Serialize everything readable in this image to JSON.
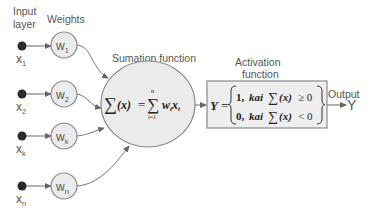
{
  "diagram": {
    "type": "perceptron-neuron-model",
    "labels": {
      "input_layer_line1": "Input",
      "input_layer_line2": "layer",
      "weights": "Weights",
      "summation": "Sumation function",
      "activation_line1": "Activation",
      "activation_line2": "function",
      "output": "Output",
      "output_symbol": "Y"
    },
    "inputs": [
      {
        "var": "x",
        "sub": "1"
      },
      {
        "var": "x",
        "sub": "2"
      },
      {
        "var": "x",
        "sub": "k"
      },
      {
        "var": "x",
        "sub": "n"
      }
    ],
    "weights": [
      {
        "var": "w",
        "sub": "1"
      },
      {
        "var": "w",
        "sub": "2"
      },
      {
        "var": "w",
        "sub": "k"
      },
      {
        "var": "w",
        "sub": "n"
      }
    ],
    "summation_formula": {
      "lhs_sigma": "∑",
      "lhs_arg": "(x)",
      "equals": "=",
      "rhs_sigma": "∑",
      "upper": "n",
      "lower": "i=1",
      "term_w": "w",
      "term_w_sub": "i",
      "term_x": "x",
      "term_x_sub": "i"
    },
    "activation_formula": {
      "lhs": "Y",
      "equals": "=",
      "case1_value": "1,",
      "case1_word": "kai",
      "case1_sigma": "∑",
      "case1_arg": "(x)",
      "case1_cond": "≥ 0",
      "case2_value": "0,",
      "case2_word": "kai",
      "case2_sigma": "∑",
      "case2_arg": "(x)",
      "case2_cond": "< 0"
    },
    "colors": {
      "node_fill": "#ebebeb",
      "stroke": "#8a8a8a",
      "input_dot": "#2a2a2a",
      "text": "#555555"
    }
  }
}
